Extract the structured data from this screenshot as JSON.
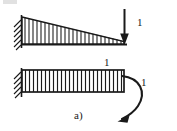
{
  "figure": {
    "caption": "a)",
    "background_color": "#ffffff",
    "ink_color": "#1a1a1a",
    "width": 177,
    "height": 131
  },
  "labels": {
    "top_point_load": "1",
    "bottom_distributed_load": "1",
    "bottom_moment": "1"
  },
  "diagram_data": {
    "type": "engineering-load-diagram",
    "title": "a)",
    "cases": [
      {
        "id": "top",
        "name": "cantilever-triangular-load-with-tip-point-load",
        "support": {
          "type": "fixed-wall",
          "side": "left",
          "hatching": "diagonal"
        },
        "beam": {
          "x_start": 22,
          "x_end": 124,
          "y": 44,
          "orientation": "horizontal"
        },
        "distributed_load": {
          "shape": "triangular",
          "max_at": "left-support",
          "min_at": "right-free-end",
          "hatch_lines": 24,
          "direction": "downward"
        },
        "point_load": {
          "label": "1",
          "direction": "down",
          "applied_at": "right-free-end",
          "arrow_x": 124,
          "arrow_y_start": 10,
          "arrow_y_end": 43
        }
      },
      {
        "id": "bottom",
        "name": "cantilever-uniform-load-with-tip-moment",
        "support": {
          "type": "fixed-wall",
          "side": "left",
          "hatching": "diagonal"
        },
        "beam": {
          "x_start": 22,
          "x_end": 124,
          "y_top": 70,
          "y_bottom": 92,
          "orientation": "horizontal"
        },
        "distributed_load": {
          "shape": "uniform",
          "label": "1",
          "hatch_lines": 26,
          "direction": "downward"
        },
        "moment": {
          "label": "1",
          "style": "curved-arrow",
          "sense": "clockwise",
          "applied_at": "right-free-end",
          "arrow_tip": "down-left"
        }
      }
    ]
  }
}
